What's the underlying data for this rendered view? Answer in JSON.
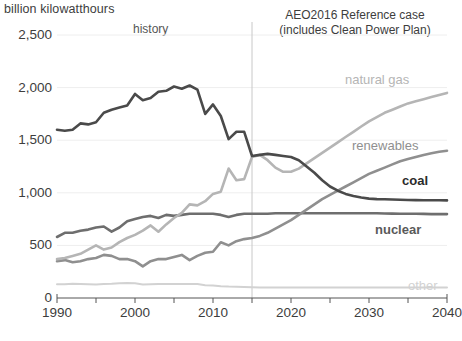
{
  "chart_data": {
    "type": "line",
    "title": "billion kilowatthours",
    "xlabel": "",
    "ylabel": "billion kilowatthours",
    "xlim": [
      1990,
      2040
    ],
    "ylim": [
      0,
      2500
    ],
    "yticks": [
      "0",
      "500",
      "1,000",
      "1,500",
      "2,000",
      "2,500"
    ],
    "ytick_values": [
      0,
      500,
      1000,
      1500,
      2000,
      2500
    ],
    "xticks": [
      "1990",
      "2000",
      "2010",
      "2020",
      "2030",
      "2040"
    ],
    "xtick_values": [
      1990,
      2000,
      2010,
      2020,
      2030,
      2040
    ],
    "minor_xtick_values": [
      1995,
      2005,
      2015,
      2025,
      2035
    ],
    "grid": true,
    "legend": "inline-right",
    "annotations": [
      {
        "name": "history",
        "text": "history",
        "x": 2001
      },
      {
        "name": "projection",
        "text": "AEO2016 Reference case (includes Clean Power Plan)",
        "x": 2027
      },
      {
        "name": "divider",
        "text": "",
        "x": 2015
      }
    ],
    "divider_year": 2015,
    "x": [
      1990,
      1991,
      1992,
      1993,
      1994,
      1995,
      1996,
      1997,
      1998,
      1999,
      2000,
      2001,
      2002,
      2003,
      2004,
      2005,
      2006,
      2007,
      2008,
      2009,
      2010,
      2011,
      2012,
      2013,
      2014,
      2015,
      2016,
      2017,
      2018,
      2019,
      2020,
      2021,
      2022,
      2023,
      2024,
      2025,
      2026,
      2027,
      2028,
      2029,
      2030,
      2031,
      2032,
      2033,
      2034,
      2035,
      2036,
      2037,
      2038,
      2039,
      2040
    ],
    "series": [
      {
        "name": "coal",
        "color": "#4a4a4a",
        "label": "coal",
        "values": [
          1600,
          1590,
          1600,
          1660,
          1650,
          1670,
          1760,
          1790,
          1810,
          1830,
          1940,
          1880,
          1900,
          1960,
          1970,
          2010,
          1990,
          2020,
          1980,
          1750,
          1840,
          1730,
          1510,
          1580,
          1580,
          1350,
          1360,
          1370,
          1360,
          1350,
          1340,
          1310,
          1250,
          1190,
          1120,
          1060,
          1020,
          990,
          970,
          955,
          945,
          940,
          938,
          936,
          934,
          932,
          931,
          930,
          930,
          929,
          928
        ]
      },
      {
        "name": "natural gas",
        "color": "#b5b5b5",
        "label": "natural gas",
        "values": [
          370,
          380,
          400,
          420,
          460,
          500,
          460,
          480,
          530,
          570,
          600,
          640,
          690,
          630,
          700,
          760,
          810,
          890,
          880,
          920,
          990,
          1010,
          1230,
          1120,
          1130,
          1340,
          1360,
          1310,
          1240,
          1200,
          1200,
          1230,
          1280,
          1330,
          1380,
          1430,
          1480,
          1530,
          1580,
          1630,
          1680,
          1720,
          1760,
          1790,
          1820,
          1850,
          1870,
          1890,
          1910,
          1930,
          1950
        ]
      },
      {
        "name": "renewables",
        "color": "#8f8f8f",
        "label": "renewables",
        "values": [
          350,
          360,
          340,
          350,
          370,
          380,
          410,
          400,
          370,
          370,
          350,
          300,
          350,
          370,
          370,
          390,
          410,
          360,
          400,
          430,
          440,
          530,
          500,
          540,
          560,
          570,
          590,
          620,
          660,
          700,
          740,
          790,
          840,
          890,
          940,
          980,
          1020,
          1060,
          1100,
          1140,
          1180,
          1210,
          1240,
          1270,
          1300,
          1320,
          1340,
          1360,
          1375,
          1390,
          1400
        ]
      },
      {
        "name": "nuclear",
        "color": "#6e6e6e",
        "label": "nuclear",
        "values": [
          580,
          620,
          620,
          640,
          650,
          670,
          680,
          630,
          670,
          730,
          750,
          770,
          780,
          760,
          790,
          780,
          790,
          800,
          800,
          800,
          800,
          790,
          770,
          790,
          800,
          800,
          800,
          800,
          805,
          805,
          805,
          805,
          805,
          805,
          805,
          805,
          805,
          805,
          805,
          805,
          805,
          805,
          803,
          802,
          801,
          800,
          800,
          799,
          798,
          798,
          798
        ]
      },
      {
        "name": "other",
        "color": "#d2d2d2",
        "label": "other",
        "values": [
          130,
          130,
          135,
          133,
          130,
          128,
          132,
          135,
          140,
          142,
          140,
          128,
          130,
          133,
          133,
          132,
          133,
          134,
          132,
          122,
          118,
          112,
          108,
          106,
          104,
          102,
          101,
          100,
          100,
          100,
          100,
          100,
          100,
          100,
          100,
          100,
          100,
          100,
          100,
          100,
          100,
          100,
          100,
          100,
          100,
          100,
          100,
          100,
          100,
          100,
          100
        ]
      }
    ],
    "series_label_positions": [
      {
        "name": "natural gas",
        "x": 345,
        "y": 72
      },
      {
        "name": "renewables",
        "x": 352,
        "y": 138
      },
      {
        "name": "coal",
        "x": 402,
        "y": 173
      },
      {
        "name": "nuclear",
        "x": 375,
        "y": 222
      },
      {
        "name": "other",
        "x": 408,
        "y": 278
      }
    ]
  }
}
